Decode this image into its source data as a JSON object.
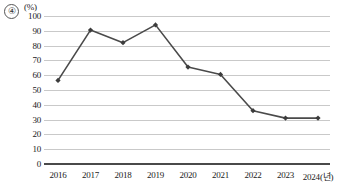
{
  "figure": {
    "item_number": "④",
    "unit_label": "(%)"
  },
  "chart_data": {
    "type": "line",
    "title": "",
    "subtitle": "",
    "xlabel": "",
    "ylabel": "",
    "unit": "(%)",
    "x_axis_suffix": "(년)",
    "categories": [
      "2016",
      "2017",
      "2018",
      "2019",
      "2020",
      "2021",
      "2022",
      "2023",
      "2024"
    ],
    "x_tick_labels": [
      "2016",
      "2017",
      "2018",
      "2019",
      "2020",
      "2021",
      "2022",
      "2023",
      "2024(년)"
    ],
    "values": [
      56.5,
      90.5,
      82.0,
      94.0,
      65.5,
      60.5,
      36.0,
      31.0,
      31.0
    ],
    "y_tick_labels": [
      "0",
      "10",
      "20",
      "30",
      "40",
      "50",
      "60",
      "70",
      "80",
      "90",
      "100"
    ],
    "y_ticks": [
      0,
      10,
      20,
      30,
      40,
      50,
      60,
      70,
      80,
      90,
      100
    ],
    "ylim": [
      0,
      100
    ],
    "grid": true,
    "grid_axis": "y",
    "legend": false,
    "legend_position": "none",
    "marker": "diamond",
    "series": [
      {
        "name": "",
        "values": [
          56.5,
          90.5,
          82.0,
          94.0,
          65.5,
          60.5,
          36.0,
          31.0,
          31.0
        ]
      }
    ]
  },
  "colors": {
    "line": "#4a4a4a",
    "marker": "#3c3c3c",
    "gridline": "#c9c9c9",
    "axis": "#4a4a4a",
    "text": "#1a1a1a",
    "background": "#ffffff"
  }
}
